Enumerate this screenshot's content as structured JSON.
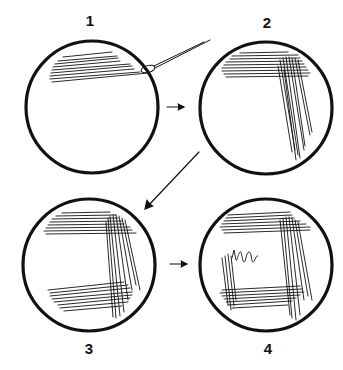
{
  "diagram": {
    "type": "streak-plate-sequence",
    "colors": {
      "stroke": "#111111",
      "background": "#ffffff"
    },
    "steps": [
      {
        "label": "1",
        "streaks": "top quadrant streaks with inoculating loop"
      },
      {
        "label": "2",
        "streaks": "second set of streaks down right side"
      },
      {
        "label": "3",
        "streaks": "third set of streaks along bottom"
      },
      {
        "label": "4",
        "streaks": "fourth set up left side ending in zigzag into center"
      }
    ],
    "arrows": [
      "1 to 2",
      "2 to 3",
      "3 to 4"
    ]
  }
}
